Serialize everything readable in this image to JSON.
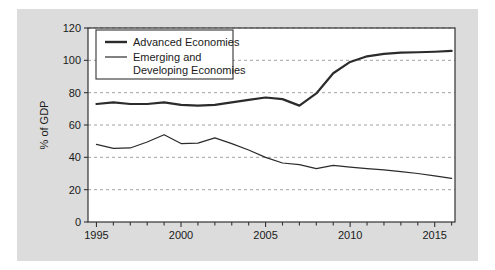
{
  "figure": {
    "background_color": "#dcdcdc",
    "plot_background_color": "#ffffff",
    "frame_color": "#333333",
    "grid_color": "#999999",
    "series_color": "#2b2b2b"
  },
  "chart_data": {
    "type": "line",
    "title": "",
    "subtitle": "",
    "xlabel": "",
    "ylabel": "% of GDP",
    "xlim": [
      1994.5,
      2016.2
    ],
    "ylim": [
      0,
      120
    ],
    "yticks": [
      0,
      20,
      40,
      60,
      80,
      100,
      120
    ],
    "ytick_labels": [
      "0",
      "20",
      "40",
      "60",
      "80",
      "100",
      "120"
    ],
    "xticks": [
      1995,
      1996,
      1997,
      1998,
      1999,
      2000,
      2001,
      2002,
      2003,
      2004,
      2005,
      2006,
      2007,
      2008,
      2009,
      2010,
      2011,
      2012,
      2013,
      2014,
      2015,
      2016
    ],
    "xtick_labels_shown": [
      "1995",
      "2000",
      "2005",
      "2010",
      "2015"
    ],
    "xtick_label_values": [
      1995,
      2000,
      2005,
      2010,
      2015
    ],
    "grid": "horizontal-dashed",
    "legend_position": "top-left",
    "x": [
      1995,
      1996,
      1997,
      1998,
      1999,
      2000,
      2001,
      2002,
      2003,
      2004,
      2005,
      2006,
      2007,
      2008,
      2009,
      2010,
      2011,
      2012,
      2013,
      2014,
      2015,
      2016
    ],
    "series": [
      {
        "name": "Advanced Economies",
        "line_width": 2.2,
        "values": [
          73.0,
          74.0,
          73.0,
          73.0,
          74.0,
          72.5,
          72.0,
          72.5,
          74.0,
          75.5,
          77.0,
          76.0,
          72.0,
          79.5,
          92.0,
          99.0,
          102.5,
          104.0,
          104.8,
          105.0,
          105.3,
          105.8
        ]
      },
      {
        "name": "Emerging and Developing Economies",
        "line_width": 1.2,
        "values": [
          48.0,
          45.5,
          45.8,
          49.5,
          54.0,
          48.5,
          48.8,
          52.0,
          48.5,
          44.5,
          40.0,
          36.5,
          35.5,
          33.0,
          35.0,
          34.0,
          33.0,
          32.2,
          31.2,
          30.0,
          28.5,
          27.0
        ]
      }
    ]
  },
  "legend": {
    "items": [
      {
        "label": "Advanced Economies",
        "label_line2": ""
      },
      {
        "label": "Emerging and",
        "label_line2": "Developing Economies"
      }
    ]
  }
}
